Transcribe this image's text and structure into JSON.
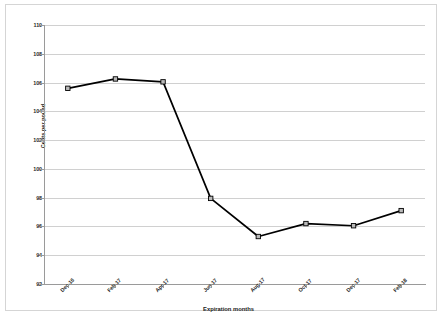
{
  "chart_data": {
    "type": "line",
    "title": "",
    "xlabel": "Expiration months",
    "ylabel": "Cents per pound",
    "categories": [
      "Dec-16",
      "Feb-17",
      "Apr-17",
      "Jun-17",
      "Aug-17",
      "Oct-17",
      "Dec-17",
      "Feb-18"
    ],
    "values": [
      105.6,
      106.25,
      106.05,
      97.95,
      95.3,
      96.2,
      96.05,
      97.1
    ],
    "series": [
      {
        "name": "Cents per pound",
        "values": [
          105.6,
          106.25,
          106.05,
          97.95,
          95.3,
          96.2,
          96.05,
          97.1
        ]
      }
    ],
    "ylim": [
      92,
      110
    ],
    "ytick_step": 2,
    "ytick_labels": [
      "110",
      "108",
      "106",
      "104",
      "102",
      "100",
      "98",
      "96",
      "94",
      "92"
    ],
    "ytick_values": [
      110,
      108,
      106,
      104,
      102,
      100,
      98,
      96,
      94,
      92
    ],
    "grid": "horizontal",
    "legend": "none",
    "line_color": "#000000",
    "marker": "square-open",
    "marker_fill": "#b9b9b9",
    "marker_edge": "#000000",
    "grid_color": "#d0d0d0",
    "axis_color": "#9a9a9a",
    "background": "#ffffff",
    "xtick_rotation": -45
  }
}
